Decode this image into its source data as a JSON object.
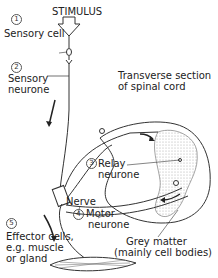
{
  "labels": {
    "stimulus": "STIMULUS",
    "sensory_cell": {
      "number": "1",
      "text": "Sensory cell"
    },
    "sensory_neurone": {
      "number": "2",
      "line1": "Sensory",
      "line2": "neurone"
    },
    "transverse": {
      "line1": "Transverse section",
      "line2": "of spinal cord"
    },
    "relay_neurone": {
      "number": "3",
      "line1": "Relay",
      "line2": "neurone"
    },
    "nerve": "Nerve",
    "motor_neurone": {
      "number": "4",
      "line1": "Motor",
      "line2": "neurone"
    },
    "effector": {
      "number": "5",
      "line1": "Effector cells,",
      "line2": "e.g. muscle",
      "line3": "or gland"
    },
    "grey_matter": {
      "line1": "Grey matter",
      "line2": "(mainly cell bodies)"
    }
  }
}
